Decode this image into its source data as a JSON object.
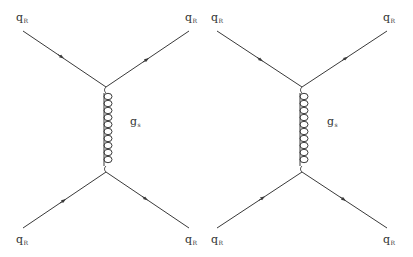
{
  "colors": {
    "line": "#3a3a3a",
    "text": "#333333",
    "background": "#ffffff"
  },
  "diagrams": [
    {
      "id": "left",
      "labels": {
        "top_left": {
          "base": "q",
          "sub": "R"
        },
        "top_right": {
          "base": "q",
          "sub": "R"
        },
        "bottom_left": {
          "base": "q",
          "sub": "R"
        },
        "bottom_right": {
          "base": "q",
          "sub": "R"
        },
        "gluon": {
          "base": "g",
          "sub": "s"
        }
      }
    },
    {
      "id": "right",
      "labels": {
        "top_left": {
          "base": "q",
          "sub": "R"
        },
        "top_right": {
          "base": "q",
          "sub": "R"
        },
        "bottom_left": {
          "base": "q",
          "sub": "R"
        },
        "bottom_right": {
          "base": "q",
          "sub": "R"
        },
        "gluon": {
          "base": "g",
          "sub": "s"
        }
      }
    }
  ]
}
